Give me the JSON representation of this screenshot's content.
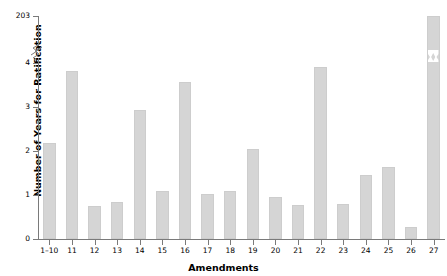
{
  "chart_data": {
    "type": "bar",
    "title": "",
    "xlabel": "Amendments",
    "ylabel": "Number of Years for Ratification",
    "categories": [
      "1–10",
      "11",
      "12",
      "13",
      "14",
      "15",
      "16",
      "17",
      "18",
      "19",
      "20",
      "21",
      "22",
      "23",
      "24",
      "25",
      "26",
      "27"
    ],
    "values": [
      2.18,
      3.82,
      0.75,
      0.84,
      2.93,
      1.1,
      3.57,
      1.03,
      1.1,
      2.04,
      0.95,
      0.77,
      3.91,
      0.79,
      1.45,
      1.64,
      0.28,
      203
    ],
    "ytick_labels": [
      "0",
      "1",
      "2",
      "3",
      "4",
      "203"
    ],
    "ytick_values": [
      0,
      1,
      2,
      3,
      4,
      203
    ],
    "ylim": [
      0,
      203
    ],
    "axis_break": {
      "between": [
        4,
        203
      ],
      "style": "zigzag"
    },
    "grid": false,
    "legend": null,
    "bar_color": "#d5d5d5",
    "axis_color": "#7a7a7a",
    "text_color": "#000000"
  }
}
